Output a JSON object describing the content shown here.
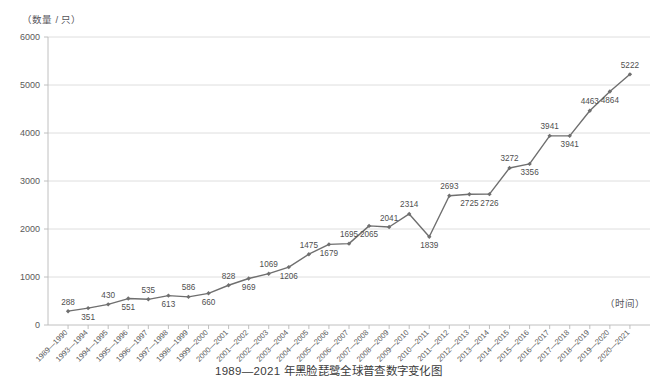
{
  "axis_titles": {
    "y": "（数量 / 只）",
    "x": "（时间）"
  },
  "caption": "1989—2021 年黑脸琵鹭全球普查数字变化图",
  "chart_data": {
    "type": "line",
    "title": "1989—2021 年黑脸琵鹭全球普查数字变化图",
    "xlabel": "（时间）",
    "ylabel": "（数量 / 只）",
    "ylim": [
      0,
      6000
    ],
    "ytick_labels": [
      "0",
      "1000",
      "2000",
      "3000",
      "4000",
      "5000",
      "6000"
    ],
    "yticks": [
      0,
      1000,
      2000,
      3000,
      4000,
      5000,
      6000
    ],
    "grid": true,
    "legend": "none",
    "marker": "diamond",
    "line_color": "#6f6f6f",
    "grid_color": "#d6d6d6",
    "categories": [
      "1989—1990",
      "1993—1994",
      "1994—1995",
      "1995—1996",
      "1996—1997",
      "1997—1998",
      "1998—1999",
      "1999—2000",
      "2000—2001",
      "2001—2002",
      "2002—2003",
      "2003—2004",
      "2004—2005",
      "2005—2006",
      "2006—2007",
      "2007—2008",
      "2008—2009",
      "2009—2010",
      "2010—2011",
      "2011—2012",
      "2012—2013",
      "2013—2014",
      "2014—2015",
      "2015—2016",
      "2016—2017",
      "2017—2018",
      "2018—2019",
      "2019—2020",
      "2020—2021"
    ],
    "values": [
      288,
      351,
      430,
      551,
      535,
      613,
      586,
      660,
      828,
      969,
      1069,
      1206,
      1475,
      1679,
      1695,
      2065,
      2041,
      2314,
      1839,
      2693,
      2725,
      2726,
      3272,
      3356,
      3941,
      3941,
      4463,
      4864,
      5222
    ],
    "label_positions": [
      "above",
      "below",
      "above",
      "below",
      "above",
      "below",
      "above",
      "below",
      "above",
      "below",
      "above",
      "below",
      "above",
      "below",
      "above",
      "below",
      "above",
      "above",
      "below",
      "above",
      "below",
      "below",
      "above",
      "below",
      "above",
      "below",
      "above",
      "below",
      "above"
    ]
  }
}
